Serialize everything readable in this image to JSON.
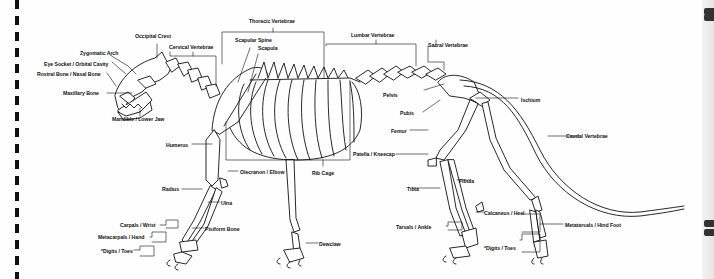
{
  "diagram": {
    "labels": {
      "occipital_crest": "Occipital Crest",
      "zygomatic_arch": "Zygomatic Arch",
      "eye_socket": "Eye Socket / Orbital Cavity",
      "rostral_bone": "Rostral Bone / Nasal Bone",
      "maxillary_bone": "Maxillary Bone",
      "mandible": "Mandible / Lower Jaw",
      "cervical_vertebrae": "Cervical Vertebrae",
      "thoracic_vertebrae": "Thoracic Vertebrae",
      "scapular_spine": "Scapular Spine",
      "scapula": "Scapula",
      "lumbar_vertebrae": "Lumbar Vertebrae",
      "sacral_vertebrae": "Sacral Vertebrae",
      "pelvis": "Pelvis",
      "pubis": "Pubis",
      "ischium": "Ischium",
      "femur": "Femur",
      "caudal_vertebrae": "Caudal Vertebrae",
      "patella": "Patella / Kneecap",
      "humerus": "Humerus",
      "olecranon": "Olecranon / Elbow",
      "rib_cage": "Rib Cage",
      "fibula": "Fibula",
      "radius": "Radius",
      "ulna": "Ulna",
      "tibia": "Tibia",
      "calcaneus": "Calcaneus / Heel",
      "carpals": "Carpals / Wrist",
      "pisiform": "Pisiform Bone",
      "metacarpals": "Metacarpals / Hand",
      "digits_front": "*Digits / Toes",
      "dewclaw": "Dewclaw",
      "tarsals": "Tarsals / Ankle",
      "metatarsals": "Metatarsals / Hind Foot",
      "digits_hind": "*Digits / Toes"
    }
  }
}
